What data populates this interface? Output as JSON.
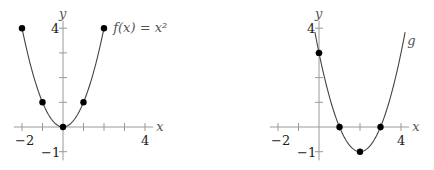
{
  "chart_data": [
    {
      "type": "line",
      "title": "",
      "function_label": "f(x) = x²",
      "xlabel": "x",
      "ylabel": "y",
      "xlim": [
        -2,
        4
      ],
      "ylim": [
        -1,
        4
      ],
      "x_tick_labels": [
        "−2",
        "4"
      ],
      "y_tick_labels": [
        "4",
        "−1"
      ],
      "points": [
        {
          "x": -2,
          "y": 4
        },
        {
          "x": -1,
          "y": 1
        },
        {
          "x": 0,
          "y": 0
        },
        {
          "x": 1,
          "y": 1
        },
        {
          "x": 2,
          "y": 4
        }
      ],
      "curve": {
        "a": 1,
        "h": 0,
        "k": 0,
        "x_range": [
          -2,
          2
        ]
      },
      "grid": false
    },
    {
      "type": "line",
      "title": "",
      "function_label": "g",
      "xlabel": "x",
      "ylabel": "y",
      "xlim": [
        -2,
        4
      ],
      "ylim": [
        -1,
        4
      ],
      "x_tick_labels": [
        "−2",
        "4"
      ],
      "y_tick_labels": [
        "4",
        "−1"
      ],
      "points": [
        {
          "x": 0,
          "y": 3
        },
        {
          "x": 1,
          "y": 0
        },
        {
          "x": 2,
          "y": -1
        },
        {
          "x": 3,
          "y": 0
        }
      ],
      "curve": {
        "a": 1,
        "h": 2,
        "k": -1,
        "x_range": [
          -0.2,
          4.2
        ]
      },
      "grid": false
    }
  ],
  "graphs": [
    {
      "origin_x": 63,
      "origin_y": 127,
      "ux": 20.5,
      "uy": 24.7
    },
    {
      "origin_x": 319,
      "origin_y": 127,
      "ux": 20.5,
      "uy": 24.7
    }
  ]
}
